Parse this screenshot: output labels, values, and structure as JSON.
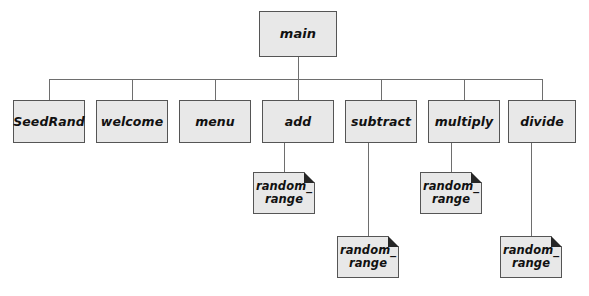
{
  "diagram": {
    "type": "hierarchy-chart",
    "title": "",
    "background_color": "#ffffff",
    "box_fill_color": "#e8e8e8",
    "box_border_color": "#555555",
    "shadow_color": "#1c1c1c",
    "line_color": "#6e6e6e",
    "nodes": [
      {
        "id": "main",
        "label": "main",
        "level": 0,
        "style": "plain",
        "x": 259,
        "y": 11,
        "w": 78,
        "h": 46
      },
      {
        "id": "seedrand",
        "label": "SeedRand",
        "level": 1,
        "style": "plain",
        "x": 13,
        "y": 100,
        "w": 72,
        "h": 43
      },
      {
        "id": "welcome",
        "label": "welcome",
        "level": 1,
        "style": "plain",
        "x": 96,
        "y": 100,
        "w": 72,
        "h": 43
      },
      {
        "id": "menu",
        "label": "menu",
        "level": 1,
        "style": "plain",
        "x": 179,
        "y": 100,
        "w": 72,
        "h": 43
      },
      {
        "id": "add",
        "label": "add",
        "level": 1,
        "style": "plain",
        "x": 262,
        "y": 100,
        "w": 72,
        "h": 43
      },
      {
        "id": "subtract",
        "label": "subtract",
        "level": 1,
        "style": "plain",
        "x": 345,
        "y": 100,
        "w": 72,
        "h": 43
      },
      {
        "id": "multiply",
        "label": "multiply",
        "level": 1,
        "style": "plain",
        "x": 428,
        "y": 100,
        "w": 72,
        "h": 43
      },
      {
        "id": "divide",
        "label": "divide",
        "level": 1,
        "style": "plain",
        "x": 508,
        "y": 100,
        "w": 68,
        "h": 43
      },
      {
        "id": "rr-add",
        "label": "random_\nrange",
        "level": 2,
        "style": "folded",
        "x": 253,
        "y": 172,
        "w": 62,
        "h": 42
      },
      {
        "id": "rr-multiply",
        "label": "random_\nrange",
        "level": 2,
        "style": "folded",
        "x": 420,
        "y": 172,
        "w": 62,
        "h": 42
      },
      {
        "id": "rr-subtract",
        "label": "random_\nrange",
        "level": 2,
        "style": "folded",
        "x": 337,
        "y": 236,
        "w": 62,
        "h": 42
      },
      {
        "id": "rr-divide",
        "label": "random_\nrange",
        "level": 2,
        "style": "folded",
        "x": 500,
        "y": 236,
        "w": 62,
        "h": 42
      }
    ],
    "edges": [
      {
        "from": "main",
        "to": "seedrand"
      },
      {
        "from": "main",
        "to": "welcome"
      },
      {
        "from": "main",
        "to": "menu"
      },
      {
        "from": "main",
        "to": "add"
      },
      {
        "from": "main",
        "to": "subtract"
      },
      {
        "from": "main",
        "to": "multiply"
      },
      {
        "from": "main",
        "to": "divide"
      },
      {
        "from": "add",
        "to": "rr-add"
      },
      {
        "from": "multiply",
        "to": "rr-multiply"
      },
      {
        "from": "subtract",
        "to": "rr-subtract"
      },
      {
        "from": "divide",
        "to": "rr-divide"
      }
    ],
    "bus": {
      "x1": 49,
      "x2": 542,
      "y": 79
    }
  }
}
